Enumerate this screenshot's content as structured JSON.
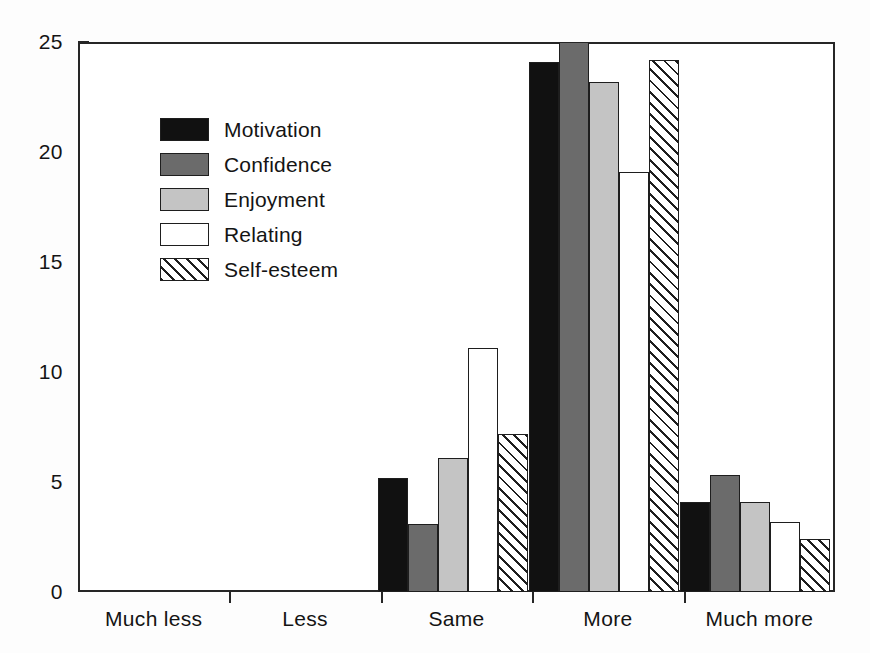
{
  "chart_data": {
    "type": "bar",
    "title": "",
    "subtitle": "",
    "xlabel": "",
    "ylabel": "",
    "categories": [
      "Much less",
      "Less",
      "Same",
      "More",
      "Much more"
    ],
    "series": [
      {
        "name": "Motivation",
        "style": "solid-black",
        "color": "#111111",
        "values": [
          0,
          0,
          5.2,
          24.1,
          4.1
        ]
      },
      {
        "name": "Confidence",
        "style": "solid-dark-gray",
        "color": "#6b6b6b",
        "values": [
          0,
          0,
          3.1,
          25.0,
          5.3
        ]
      },
      {
        "name": "Enjoyment",
        "style": "solid-light-gray",
        "color": "#c4c4c4",
        "values": [
          0,
          0,
          6.1,
          23.2,
          4.1
        ]
      },
      {
        "name": "Relating",
        "style": "open-white",
        "color": "#ffffff",
        "values": [
          0,
          0,
          11.1,
          19.1,
          3.2
        ]
      },
      {
        "name": "Self-esteem",
        "style": "diagonal-hatch",
        "color": "#ffffff",
        "values": [
          0,
          0,
          7.2,
          24.2,
          2.4
        ]
      }
    ],
    "ylim": [
      0,
      25
    ],
    "yticks": [
      0,
      5,
      10,
      15,
      20,
      25
    ],
    "ytick_labels": [
      "0",
      "5",
      "10",
      "15",
      "20",
      "25"
    ],
    "grid": false,
    "legend_position": "upper-left-inside",
    "axis_color": "#262626",
    "background": "#ffffff"
  }
}
